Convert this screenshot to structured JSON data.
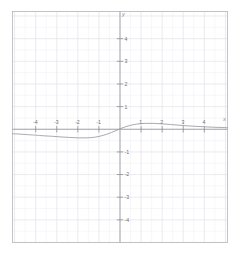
{
  "figure": {
    "kind": "cartesian-plane",
    "background_color": "#ffffff",
    "border_color": "#b9b9bf",
    "axis_color": "#8e8e96",
    "grid_major_color": "#e2e2e8",
    "grid_minor_color": "#f1f1f5",
    "curve_color": "#9a9aa2"
  },
  "axes": {
    "x_axis_label": "x",
    "y_axis_label": "y",
    "x_ticks": [
      {
        "value": -4,
        "label": "-4"
      },
      {
        "value": -3,
        "label": "-3"
      },
      {
        "value": -2,
        "label": "-2"
      },
      {
        "value": -1,
        "label": "-1"
      },
      {
        "value": 1,
        "label": "1"
      },
      {
        "value": 2,
        "label": "2"
      },
      {
        "value": 3,
        "label": "3"
      },
      {
        "value": 4,
        "label": "4"
      }
    ],
    "y_ticks": [
      {
        "value": 4,
        "label": "4"
      },
      {
        "value": 3,
        "label": "3"
      },
      {
        "value": 2,
        "label": "2"
      },
      {
        "value": 1,
        "label": "1"
      },
      {
        "value": -1,
        "label": "-1"
      },
      {
        "value": -2,
        "label": "-2"
      },
      {
        "value": -3,
        "label": "-3"
      },
      {
        "value": -4,
        "label": "-4"
      }
    ]
  },
  "chart_data": {
    "type": "line",
    "title": "",
    "xlabel": "x",
    "ylabel": "y",
    "xlim": [
      -5.1,
      5.1
    ],
    "ylim": [
      -5.0,
      5.2
    ],
    "grid": true,
    "legend": null,
    "series": [
      {
        "name": "curve",
        "x": [
          -5.1,
          -4.8,
          -4.5,
          -4.2,
          -4.0,
          -3.6,
          -3.2,
          -2.8,
          -2.4,
          -2.0,
          -1.6,
          -1.2,
          -0.8,
          -0.4,
          0.0,
          0.4,
          0.8,
          1.2,
          1.6,
          2.0,
          2.4,
          2.8,
          3.2,
          3.6,
          4.0,
          4.4,
          4.8,
          5.1
        ],
        "y": [
          -0.2,
          -0.21,
          -0.23,
          -0.25,
          -0.26,
          -0.29,
          -0.31,
          -0.34,
          -0.36,
          -0.38,
          -0.38,
          -0.35,
          -0.27,
          -0.14,
          0.02,
          0.15,
          0.23,
          0.26,
          0.26,
          0.24,
          0.21,
          0.18,
          0.15,
          0.13,
          0.11,
          0.09,
          0.08,
          0.07
        ]
      }
    ]
  }
}
